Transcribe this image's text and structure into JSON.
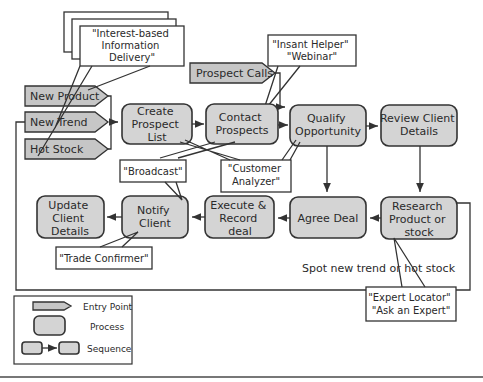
{
  "entry_points": [
    {
      "label": "New Product"
    },
    {
      "label": "New Trend"
    },
    {
      "label": "Hot Stock"
    },
    {
      "label": "Prospect Calls"
    }
  ],
  "processes": {
    "create_prospect_list": [
      "Create",
      "Prospect",
      "List"
    ],
    "contact_prospects": [
      "Contact",
      "Prospects"
    ],
    "qualify_opportunity": [
      "Qualify",
      "Opportunity"
    ],
    "review_client_details": [
      "Review Client",
      "Details"
    ],
    "research_product": [
      "Research",
      "Product or",
      "stock"
    ],
    "agree_deal": [
      "Agree Deal"
    ],
    "execute_record_deal": [
      "Execute &",
      "Record",
      "deal"
    ],
    "notify_client": [
      "Notify",
      "Client"
    ],
    "update_client_details": [
      "Update",
      "Client",
      "Details"
    ]
  },
  "callouts": {
    "interest_based": [
      "\"Interest-based",
      "Information",
      "Delivery\""
    ],
    "instant_helper": [
      "\"Insant Helper\"",
      "\"Webinar\""
    ],
    "broadcast": [
      "\"Broadcast\""
    ],
    "customer_analyzer": [
      "\"Customer",
      "Analyzer\""
    ],
    "trade_confirmer": [
      "\"Trade Confirmer\""
    ],
    "expert_locator": [
      "\"Expert Locator\"",
      "\"Ask an Expert\""
    ]
  },
  "loop_label": "Spot new trend or hot stock",
  "legend": {
    "entry_point": "Entry Point",
    "process": "Process",
    "sequence": "Sequence"
  },
  "colors": {
    "process_fill": "#d4d4d4",
    "entry_fill": "#c6c6c6",
    "stroke": "#333333"
  }
}
